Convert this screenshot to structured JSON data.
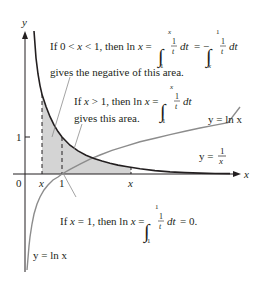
{
  "figure": {
    "axes": {
      "x_label": "x",
      "y_label": "y",
      "origin_label": "0",
      "y_tick_label": "1",
      "x_tick_labels": [
        "x",
        "1",
        "x"
      ]
    },
    "curves": [
      {
        "name": "reciprocal",
        "label_left": "y =",
        "numerator": "1",
        "denominator": "x",
        "color": "#231f20"
      },
      {
        "name": "natural-log",
        "label": "y = ln x",
        "color": "#8c8c8c"
      }
    ],
    "shaded_region_color": "#d4d4d4",
    "annotations": {
      "left_area": {
        "line1_prefix": "If 0 < ",
        "line1_var": "x",
        "line1_mid": " < 1, then ln ",
        "line1_var2": "x",
        "line1_eq": " =",
        "int1_upper": "x",
        "int1_lower": "1",
        "integrand_num": "1",
        "integrand_den": "t",
        "dt": "dt",
        "eq_neg": "= −",
        "int2_upper": "1",
        "int2_lower": "x",
        "line2": "gives the negative of this area."
      },
      "right_area": {
        "line1_prefix": "If ",
        "line1_var": "x",
        "line1_mid": " > 1, then ln ",
        "line1_var2": "x",
        "line1_eq": " =",
        "int_upper": "x",
        "int_lower": "1",
        "integrand_num": "1",
        "integrand_den": "t",
        "dt": "dt",
        "line2": "gives this area."
      },
      "at_one": {
        "line1_prefix": "If ",
        "line1_var": "x",
        "line1_mid": " = 1, then ln ",
        "line1_var2": "x",
        "line1_eq": " =",
        "int_upper": "1",
        "int_lower": "1",
        "integrand_num": "1",
        "integrand_den": "t",
        "dt": "dt",
        "result": "= 0."
      }
    },
    "ln_label_right": "y = ln x",
    "ln_label_bottom": "y = ln x"
  }
}
